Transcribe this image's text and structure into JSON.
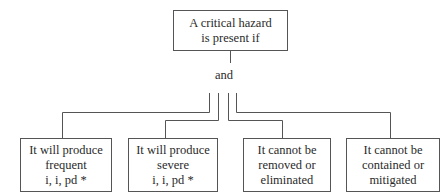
{
  "root": {
    "lines": [
      "A critical hazard",
      "is present if"
    ]
  },
  "connector": {
    "label": "and"
  },
  "children": [
    {
      "lines": [
        "It will produce",
        "frequent",
        "i, i, pd *"
      ]
    },
    {
      "lines": [
        "It will produce",
        "severe",
        "i, i, pd *"
      ]
    },
    {
      "lines": [
        "It cannot be",
        "removed or",
        "eliminated"
      ]
    },
    {
      "lines": [
        "It cannot be",
        "contained or",
        "mitigated"
      ]
    }
  ],
  "colors": {
    "line": "#555555",
    "text": "#2a2a2a",
    "background": "#ffffff"
  }
}
